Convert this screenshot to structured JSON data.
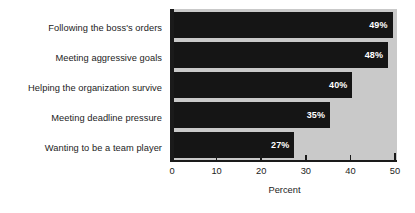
{
  "chart_data": {
    "type": "bar",
    "orientation": "horizontal",
    "title": "",
    "xlabel": "Percent",
    "ylabel": "",
    "xlim": [
      0,
      50
    ],
    "xticks": [
      0,
      10,
      20,
      30,
      40,
      50
    ],
    "xtick_labels": [
      "0",
      "10",
      "20",
      "30",
      "40",
      "50"
    ],
    "grid": false,
    "legend": null,
    "categories": [
      "Following the boss's orders",
      "Meeting aggressive goals",
      "Helping the organization survive",
      "Meeting deadline pressure",
      "Wanting to be a team player"
    ],
    "values": [
      49,
      48,
      40,
      35,
      27
    ],
    "value_labels": [
      "49%",
      "48%",
      "40%",
      "35%",
      "27%"
    ],
    "colors": {
      "bar": "#151515",
      "plot_background": "#c9c9c9",
      "axis": "#1a1a1a",
      "value_text": "#ffffff",
      "label_text": "#1c1c1c",
      "page_background": "#ffffff"
    }
  }
}
